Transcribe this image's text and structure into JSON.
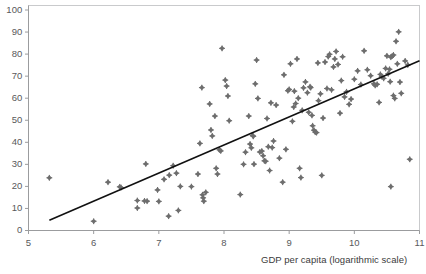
{
  "chart_data": {
    "type": "scatter",
    "title": "",
    "xlabel": "GDP per capita (logarithmic scale)",
    "ylabel": "",
    "xlim": [
      5,
      11
    ],
    "ylim": [
      0,
      100
    ],
    "xticks": [
      5,
      6,
      7,
      8,
      9,
      10,
      11
    ],
    "xtick_labels": [
      "5",
      "6",
      "7",
      "8",
      "9",
      "10",
      "11"
    ],
    "yticks": [
      0,
      10,
      20,
      30,
      40,
      50,
      60,
      70,
      80,
      90,
      100
    ],
    "ytick_labels": [
      "0",
      "10",
      "20",
      "30",
      "40",
      "50",
      "60",
      "70",
      "80",
      "90",
      "100"
    ],
    "grid": false,
    "legend": null,
    "marker": {
      "shape": "diamond-cross",
      "color": "#6e6e6e",
      "size": 3
    },
    "trendline": {
      "type": "linear",
      "color": "#111111",
      "x_start": 5.32,
      "y_start": 4.6,
      "x_end": 11.0,
      "y_end": 77.0
    },
    "points": [
      [
        5.32,
        23.9
      ],
      [
        6.0,
        4.2
      ],
      [
        6.22,
        21.9
      ],
      [
        6.4,
        19.8
      ],
      [
        6.42,
        19.5
      ],
      [
        6.67,
        13.6
      ],
      [
        6.67,
        10.2
      ],
      [
        6.78,
        13.4
      ],
      [
        6.82,
        13.3
      ],
      [
        6.8,
        30.2
      ],
      [
        6.98,
        18.4
      ],
      [
        7.0,
        13.2
      ],
      [
        7.08,
        23.2
      ],
      [
        7.15,
        6.5
      ],
      [
        7.16,
        25.1
      ],
      [
        7.22,
        29.4
      ],
      [
        7.27,
        26.0
      ],
      [
        7.3,
        9.1
      ],
      [
        7.33,
        20.0
      ],
      [
        7.5,
        19.9
      ],
      [
        7.6,
        25.6
      ],
      [
        7.63,
        39.5
      ],
      [
        7.66,
        64.8
      ],
      [
        7.67,
        16.2
      ],
      [
        7.68,
        14.8
      ],
      [
        7.69,
        13.3
      ],
      [
        7.72,
        17.3
      ],
      [
        7.78,
        57.4
      ],
      [
        7.8,
        45.6
      ],
      [
        7.82,
        42.9
      ],
      [
        7.86,
        51.9
      ],
      [
        7.88,
        28.2
      ],
      [
        7.9,
        25.6
      ],
      [
        7.93,
        36.6
      ],
      [
        7.95,
        36.1
      ],
      [
        7.97,
        82.6
      ],
      [
        8.02,
        68.2
      ],
      [
        8.04,
        65.5
      ],
      [
        8.06,
        61.0
      ],
      [
        8.08,
        49.8
      ],
      [
        8.25,
        16.3
      ],
      [
        8.3,
        30.0
      ],
      [
        8.33,
        35.5
      ],
      [
        8.38,
        51.9
      ],
      [
        8.4,
        39.2
      ],
      [
        8.42,
        37.5
      ],
      [
        8.44,
        43.1
      ],
      [
        8.45,
        42.7
      ],
      [
        8.46,
        30.1
      ],
      [
        8.48,
        66.5
      ],
      [
        8.5,
        77.3
      ],
      [
        8.52,
        59.9
      ],
      [
        8.55,
        35.6
      ],
      [
        8.58,
        36.0
      ],
      [
        8.6,
        33.9
      ],
      [
        8.62,
        31.6
      ],
      [
        8.64,
        31.4
      ],
      [
        8.66,
        50.8
      ],
      [
        8.68,
        38.0
      ],
      [
        8.7,
        27.2
      ],
      [
        8.72,
        57.9
      ],
      [
        8.74,
        37.6
      ],
      [
        8.76,
        40.6
      ],
      [
        8.8,
        56.9
      ],
      [
        8.85,
        32.8
      ],
      [
        8.9,
        21.9
      ],
      [
        8.92,
        70.6
      ],
      [
        8.95,
        36.8
      ],
      [
        8.98,
        63.4
      ],
      [
        9.0,
        64.0
      ],
      [
        9.02,
        75.6
      ],
      [
        9.05,
        49.5
      ],
      [
        9.07,
        56.0
      ],
      [
        9.08,
        63.2
      ],
      [
        9.1,
        57.6
      ],
      [
        9.12,
        77.8
      ],
      [
        9.14,
        60.0
      ],
      [
        9.16,
        28.2
      ],
      [
        9.18,
        24.0
      ],
      [
        9.2,
        54.5
      ],
      [
        9.22,
        64.7
      ],
      [
        9.25,
        67.4
      ],
      [
        9.28,
        62.5
      ],
      [
        9.3,
        53.6
      ],
      [
        9.32,
        65.2
      ],
      [
        9.33,
        64.8
      ],
      [
        9.35,
        52.2
      ],
      [
        9.36,
        47.5
      ],
      [
        9.38,
        45.5
      ],
      [
        9.4,
        44.6
      ],
      [
        9.42,
        44.4
      ],
      [
        9.44,
        76.0
      ],
      [
        9.45,
        58.9
      ],
      [
        9.48,
        62.0
      ],
      [
        9.5,
        25.0
      ],
      [
        9.52,
        51.0
      ],
      [
        9.55,
        76.4
      ],
      [
        9.58,
        64.4
      ],
      [
        9.6,
        78.9
      ],
      [
        9.62,
        79.9
      ],
      [
        9.65,
        63.8
      ],
      [
        9.68,
        74.2
      ],
      [
        9.7,
        77.8
      ],
      [
        9.72,
        81.2
      ],
      [
        9.75,
        75.3
      ],
      [
        9.78,
        53.2
      ],
      [
        9.8,
        68.0
      ],
      [
        9.82,
        78.8
      ],
      [
        9.85,
        60.6
      ],
      [
        9.88,
        62.9
      ],
      [
        9.92,
        57.2
      ],
      [
        9.95,
        59.6
      ],
      [
        10.0,
        68.6
      ],
      [
        10.05,
        72.4
      ],
      [
        10.1,
        66.2
      ],
      [
        10.15,
        81.5
      ],
      [
        10.2,
        72.9
      ],
      [
        10.25,
        70.2
      ],
      [
        10.3,
        66.5
      ],
      [
        10.32,
        65.8
      ],
      [
        10.35,
        66.3
      ],
      [
        10.38,
        58.1
      ],
      [
        10.4,
        70.8
      ],
      [
        10.42,
        69.8
      ],
      [
        10.45,
        69.0
      ],
      [
        10.48,
        73.5
      ],
      [
        10.5,
        79.2
      ],
      [
        10.52,
        71.1
      ],
      [
        10.54,
        73.1
      ],
      [
        10.55,
        67.5
      ],
      [
        10.56,
        78.6
      ],
      [
        10.58,
        79.1
      ],
      [
        10.6,
        79.6
      ],
      [
        10.6,
        61.2
      ],
      [
        10.62,
        59.9
      ],
      [
        10.64,
        85.8
      ],
      [
        10.66,
        75.6
      ],
      [
        10.68,
        90.1
      ],
      [
        10.7,
        67.3
      ],
      [
        10.72,
        62.2
      ],
      [
        10.56,
        19.9
      ],
      [
        10.85,
        32.3
      ],
      [
        10.78,
        76.9
      ],
      [
        10.82,
        75.1
      ]
    ]
  }
}
